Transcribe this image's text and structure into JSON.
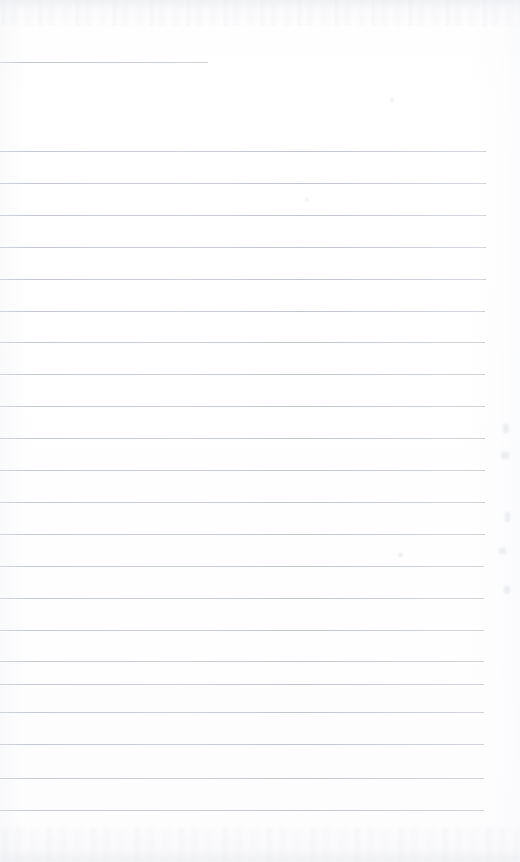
{
  "document": {
    "kind": "scanned-lined-paper",
    "title": "Blank ruled notebook page",
    "content_text": "",
    "page_width": 520,
    "page_height": 862
  },
  "colors": {
    "paper": "#fefefe",
    "rule": "#c9cdd4",
    "rule_dark": "#c1c6ce",
    "edge_noise": "#e4e6eb"
  },
  "ruling": {
    "line_count": 23,
    "spacing_px": 31.5,
    "first_line_y": 62,
    "body_start_y": 151,
    "last_line_y": 810,
    "left_x": 0,
    "right_x": 484,
    "short_line_right_x": 208
  },
  "lines": [
    {
      "y": 62,
      "x1": 0,
      "x2": 208,
      "short": true
    },
    {
      "y": 151,
      "x1": 0,
      "x2": 486,
      "short": false
    },
    {
      "y": 183,
      "x1": 0,
      "x2": 486,
      "short": false
    },
    {
      "y": 215,
      "x1": 0,
      "x2": 486,
      "short": false
    },
    {
      "y": 247,
      "x1": 0,
      "x2": 486,
      "short": false
    },
    {
      "y": 279,
      "x1": 0,
      "x2": 486,
      "short": false
    },
    {
      "y": 311,
      "x1": 0,
      "x2": 485,
      "short": false
    },
    {
      "y": 342,
      "x1": 0,
      "x2": 485,
      "short": false
    },
    {
      "y": 374,
      "x1": 0,
      "x2": 485,
      "short": false
    },
    {
      "y": 406,
      "x1": 0,
      "x2": 485,
      "short": false
    },
    {
      "y": 438,
      "x1": 0,
      "x2": 485,
      "short": false
    },
    {
      "y": 470,
      "x1": 0,
      "x2": 485,
      "short": false
    },
    {
      "y": 502,
      "x1": 0,
      "x2": 485,
      "short": false
    },
    {
      "y": 534,
      "x1": 0,
      "x2": 485,
      "short": false
    },
    {
      "y": 566,
      "x1": 0,
      "x2": 484,
      "short": false
    },
    {
      "y": 598,
      "x1": 0,
      "x2": 484,
      "short": false
    },
    {
      "y": 630,
      "x1": 0,
      "x2": 484,
      "short": false
    },
    {
      "y": 661,
      "x1": 0,
      "x2": 484,
      "short": false
    },
    {
      "y": 684,
      "x1": 0,
      "x2": 484,
      "short": false
    },
    {
      "y": 712,
      "x1": 0,
      "x2": 484,
      "short": false
    },
    {
      "y": 744,
      "x1": 0,
      "x2": 484,
      "short": false
    },
    {
      "y": 778,
      "x1": 0,
      "x2": 484,
      "short": false
    },
    {
      "y": 810,
      "x1": 0,
      "x2": 484,
      "short": false
    }
  ],
  "edge_specks": [
    {
      "x": 503,
      "y": 424,
      "w": 6,
      "h": 9
    },
    {
      "x": 501,
      "y": 452,
      "w": 8,
      "h": 7
    },
    {
      "x": 505,
      "y": 512,
      "w": 5,
      "h": 10
    },
    {
      "x": 499,
      "y": 548,
      "w": 7,
      "h": 6
    },
    {
      "x": 504,
      "y": 586,
      "w": 6,
      "h": 8
    },
    {
      "x": 390,
      "y": 98,
      "w": 4,
      "h": 4
    },
    {
      "x": 398,
      "y": 553,
      "w": 5,
      "h": 4
    },
    {
      "x": 305,
      "y": 198,
      "w": 4,
      "h": 3
    }
  ]
}
